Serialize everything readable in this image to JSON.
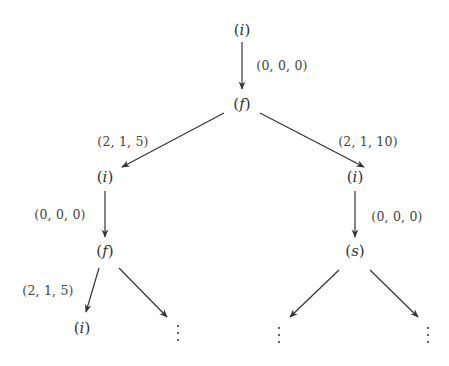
{
  "diagram": {
    "type": "tree",
    "nodes": {
      "root": {
        "label": "i",
        "x": 242,
        "y": 30
      },
      "n1": {
        "label": "f",
        "x": 242,
        "y": 104
      },
      "n2": {
        "label": "i",
        "x": 105,
        "y": 177
      },
      "n3": {
        "label": "i",
        "x": 382,
        "y": 177
      },
      "n4": {
        "label": "f",
        "x": 105,
        "y": 251
      },
      "n5": {
        "label": "s",
        "x": 355,
        "y": 251
      },
      "n6": {
        "label": "i",
        "x": 82,
        "y": 328
      },
      "n7": {
        "label": "⋮",
        "x": 178,
        "y": 334
      },
      "n8": {
        "label": "⋮",
        "x": 278,
        "y": 334
      },
      "n9": {
        "label": "⋮",
        "x": 428,
        "y": 334
      }
    },
    "edges": [
      {
        "from": "root",
        "to": "n1",
        "label": "(0, 0, 0)"
      },
      {
        "from": "n1",
        "to": "n2",
        "label": "(2, 1, 5)"
      },
      {
        "from": "n1",
        "to": "n3",
        "label": "(2, 1, 10)"
      },
      {
        "from": "n2",
        "to": "n4",
        "label": "(0, 0, 0)"
      },
      {
        "from": "n3",
        "to": "n5",
        "label": "(0, 0, 0)"
      },
      {
        "from": "n4",
        "to": "n6",
        "label": "(2, 1, 5)"
      },
      {
        "from": "n4",
        "to": "n7",
        "label": ""
      },
      {
        "from": "n5",
        "to": "n8",
        "label": ""
      },
      {
        "from": "n5",
        "to": "n9",
        "label": ""
      }
    ]
  },
  "labels": {
    "root": "(i)",
    "n1": "(f)",
    "n2": "(i)",
    "n3": "(i)",
    "n4": "(f)",
    "n5": "(s)",
    "n6": "(i)",
    "e_root_n1": "(0, 0, 0)",
    "e_n1_n2": "(2, 1, 5)",
    "e_n1_n3": "(2, 1, 10)",
    "e_n2_n4": "(0, 0, 0)",
    "e_n3_n5": "(0, 0, 0)",
    "e_n4_n6": "(2, 1, 5)"
  },
  "colors": {
    "stroke": "#333333",
    "text": "#333333",
    "background": "#ffffff"
  }
}
